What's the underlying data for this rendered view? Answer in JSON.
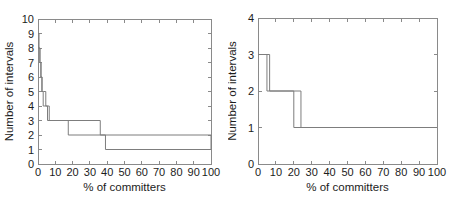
{
  "figure": {
    "background_color": "#ffffff",
    "axis_color": "#8a8a8a",
    "curve_color": "#7d7d7d",
    "panel_count": 2
  },
  "chart_data": [
    {
      "type": "line",
      "panel": "left",
      "title": "",
      "xlabel": "% of committers",
      "ylabel": "Number of intervals",
      "xlim": [
        0,
        100
      ],
      "ylim": [
        0,
        10
      ],
      "xticks": [
        0,
        10,
        20,
        30,
        40,
        50,
        60,
        70,
        80,
        90,
        100
      ],
      "xticklabels": [
        "0",
        "10",
        "20",
        "30",
        "40",
        "50",
        "60",
        "70",
        "80",
        "90",
        "100"
      ],
      "yticks": [
        0,
        1,
        2,
        3,
        4,
        5,
        6,
        7,
        8,
        9,
        10
      ],
      "yticklabels": [
        "0",
        "1",
        "2",
        "3",
        "4",
        "5",
        "6",
        "7",
        "8",
        "9",
        "10"
      ],
      "grid": false,
      "legend": null,
      "drawstyle": "steps-post",
      "series": [
        {
          "name": "series-1",
          "x": [
            0,
            0.6,
            1.2,
            1.8,
            2.4,
            3.2,
            4.5,
            6.5,
            15.5,
            36.0,
            100
          ],
          "y": [
            9,
            8,
            7,
            6,
            5,
            5,
            4,
            3,
            3,
            2,
            1
          ]
        },
        {
          "name": "series-2",
          "x": [
            0,
            1.0,
            1.6,
            2.2,
            3.0,
            4.0,
            5.5,
            7.5,
            17.5,
            39.0,
            100
          ],
          "y": [
            8,
            7,
            6,
            5,
            4,
            4,
            3,
            3,
            2,
            1,
            1
          ]
        }
      ]
    },
    {
      "type": "line",
      "panel": "right",
      "title": "",
      "xlabel": "% of committers",
      "ylabel": "Number of intervals",
      "xlim": [
        0,
        100
      ],
      "ylim": [
        0,
        4
      ],
      "xticks": [
        0,
        10,
        20,
        30,
        40,
        50,
        60,
        70,
        80,
        90,
        100
      ],
      "xticklabels": [
        "0",
        "10",
        "20",
        "30",
        "40",
        "50",
        "60",
        "70",
        "80",
        "90",
        "100"
      ],
      "yticks": [
        0,
        1,
        2,
        3,
        4
      ],
      "yticklabels": [
        "0",
        "1",
        "2",
        "3",
        "4"
      ],
      "grid": false,
      "legend": null,
      "drawstyle": "steps-post",
      "series": [
        {
          "name": "series-1",
          "x": [
            0,
            5.0,
            20.0,
            100
          ],
          "y": [
            3,
            2,
            1,
            1
          ]
        },
        {
          "name": "series-2",
          "x": [
            0,
            6.5,
            24.0,
            100
          ],
          "y": [
            3,
            2,
            1,
            1
          ]
        }
      ]
    }
  ]
}
